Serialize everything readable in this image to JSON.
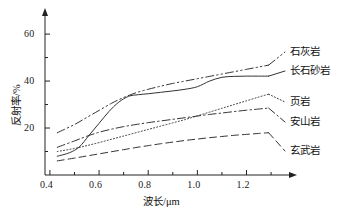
{
  "chart_data": {
    "type": "line",
    "title": "",
    "xlabel": "波长/μm",
    "ylabel": "反射率/%",
    "xlim": [
      0.38,
      1.32
    ],
    "ylim": [
      0,
      66
    ],
    "grid": false,
    "legend_position": "right-outside",
    "x_ticks": [
      "0.4",
      "0.6",
      "0.8",
      "1.0",
      "1.2"
    ],
    "x_tick_values": [
      0.4,
      0.6,
      0.8,
      1.0,
      1.2
    ],
    "x_minor_ticks": [
      0.5,
      0.7,
      0.9,
      1.1,
      1.3
    ],
    "y_ticks": [
      "20",
      "40",
      "60"
    ],
    "y_tick_values": [
      20,
      40,
      60
    ],
    "y_minor_ticks": [
      10,
      30,
      50
    ],
    "series": [
      {
        "name": "石灰岩",
        "style": "dash-dot-dot",
        "x": [
          0.43,
          0.5,
          0.55,
          0.6,
          0.65,
          0.7,
          0.75,
          0.8,
          0.85,
          0.9,
          0.95,
          1.0,
          1.05,
          1.1,
          1.15,
          1.2,
          1.25,
          1.29
        ],
        "y": [
          18.0,
          21.5,
          24.5,
          27.5,
          30.5,
          33.0,
          35.0,
          36.5,
          37.8,
          39.0,
          40.0,
          41.0,
          42.0,
          43.0,
          44.0,
          45.0,
          46.0,
          46.8
        ]
      },
      {
        "name": "长石砂岩",
        "style": "solid",
        "x": [
          0.43,
          0.48,
          0.52,
          0.56,
          0.6,
          0.64,
          0.68,
          0.72,
          0.76,
          0.8,
          0.85,
          0.9,
          0.95,
          1.0,
          1.05,
          1.1,
          1.15,
          1.2,
          1.25,
          1.29
        ],
        "y": [
          8.0,
          9.5,
          12.0,
          17.0,
          22.0,
          27.0,
          31.0,
          33.5,
          34.2,
          34.6,
          35.2,
          35.8,
          36.5,
          37.6,
          40.0,
          41.6,
          42.0,
          42.1,
          42.1,
          42.1
        ]
      },
      {
        "name": "页岩",
        "style": "dotted",
        "x": [
          0.43,
          0.5,
          0.55,
          0.6,
          0.65,
          0.7,
          0.75,
          0.8,
          0.85,
          0.9,
          0.95,
          1.0,
          1.05,
          1.1,
          1.15,
          1.2,
          1.25,
          1.29
        ],
        "y": [
          10.0,
          11.3,
          12.5,
          13.8,
          15.2,
          16.6,
          18.0,
          19.4,
          20.8,
          22.2,
          23.6,
          25.2,
          26.8,
          28.4,
          30.0,
          31.6,
          33.2,
          34.4
        ]
      },
      {
        "name": "安山岩",
        "style": "dash-dot",
        "x": [
          0.43,
          0.5,
          0.55,
          0.6,
          0.65,
          0.7,
          0.75,
          0.8,
          0.85,
          0.9,
          0.95,
          1.0,
          1.05,
          1.1,
          1.15,
          1.2,
          1.25,
          1.29
        ],
        "y": [
          11.8,
          14.5,
          16.5,
          18.2,
          19.5,
          20.6,
          21.5,
          22.3,
          23.0,
          23.7,
          24.4,
          25.1,
          25.8,
          26.4,
          27.0,
          27.6,
          28.1,
          28.5
        ]
      },
      {
        "name": "玄武岩",
        "style": "dashed",
        "x": [
          0.43,
          0.5,
          0.55,
          0.6,
          0.65,
          0.7,
          0.75,
          0.8,
          0.85,
          0.9,
          0.95,
          1.0,
          1.05,
          1.1,
          1.15,
          1.2,
          1.25,
          1.29
        ],
        "y": [
          6.0,
          7.2,
          8.1,
          9.0,
          9.9,
          10.8,
          11.7,
          12.5,
          13.3,
          14.0,
          14.7,
          15.3,
          15.9,
          16.4,
          16.9,
          17.3,
          17.7,
          18.0
        ]
      }
    ]
  },
  "legend": {
    "items": [
      {
        "label": "石灰岩"
      },
      {
        "label": "长石砂岩"
      },
      {
        "label": "页岩"
      },
      {
        "label": "安山岩"
      },
      {
        "label": "玄武岩"
      }
    ]
  },
  "colors": {
    "axis": "#222222",
    "line": "#333333",
    "background": "#ffffff"
  }
}
